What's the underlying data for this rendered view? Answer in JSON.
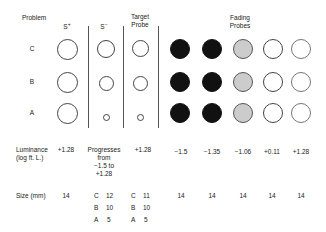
{
  "headers": {
    "problem": "Problem",
    "s_plus": "S",
    "s_plus_sup": "+",
    "s_minus": "S",
    "s_minus_sup": "−",
    "target_probe_line1": "Target",
    "target_probe_line2": "Probe",
    "fading_probes_line1": "Fading",
    "fading_probes_line2": "Probes"
  },
  "rows": [
    "C",
    "B",
    "A"
  ],
  "luminance": {
    "label_line1": "Luminance",
    "label_line2": "(log ft. L.)",
    "s_plus": "+1.28",
    "s_minus_line1": "Progresses",
    "s_minus_line2": "from",
    "s_minus_line3": "−1.5 to",
    "s_minus_line4": "+1.28",
    "target": "+1.28",
    "fading": [
      "−1.5",
      "−1.35",
      "−1.06",
      "+0.11",
      "+1.28"
    ]
  },
  "size": {
    "label": "Size (mm)",
    "s_plus": "14",
    "s_minus": [
      {
        "row": "C",
        "value": "12"
      },
      {
        "row": "B",
        "value": "10"
      },
      {
        "row": "A",
        "value": "5"
      }
    ],
    "target": [
      {
        "row": "C",
        "value": "11"
      },
      {
        "row": "B",
        "value": "10"
      },
      {
        "row": "A",
        "value": "5"
      }
    ],
    "fading": [
      "14",
      "14",
      "14",
      "14",
      "14"
    ]
  },
  "colors": {
    "dark": "#111111",
    "gray": "#cccccc",
    "outline": "#444444"
  }
}
